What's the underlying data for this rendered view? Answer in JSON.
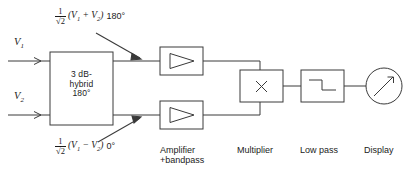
{
  "diagram": {
    "stroke_color": "#3a3a3a",
    "text_color": "#1b1b1b",
    "background": "#ffffff",
    "inputs": [
      {
        "name": "input-v1",
        "label": "V",
        "subscript": "1"
      },
      {
        "name": "input-v2",
        "label": "V",
        "subscript": "2"
      }
    ],
    "blocks": {
      "hybrid": {
        "line1": "3 dB-",
        "line2": "hybrid",
        "line3": "180°"
      },
      "amplifier_top": {
        "symbol": "triangle-right"
      },
      "amplifier_bottom": {
        "symbol": "triangle-right"
      },
      "multiplier": {
        "symbol": "X"
      },
      "lowpass": {
        "symbol": "step-down-waveform"
      },
      "display": {
        "symbol": "meter-needle"
      }
    },
    "annotations": {
      "sum_branch": {
        "numerator": "1",
        "denominator": "√2",
        "expression": "(V1 + V2)",
        "expr_lead": "(V",
        "expr_sub1": "1",
        "expr_mid": " + V",
        "expr_sub2": "2",
        "expr_tail": ")",
        "phase": "180°"
      },
      "diff_branch": {
        "numerator": "1",
        "denominator": "√2",
        "expression": "(V1 − V2)",
        "expr_lead": "(V",
        "expr_sub1": "1",
        "expr_mid": " − V",
        "expr_sub2": "2",
        "expr_tail": ")",
        "phase": "0°"
      }
    },
    "captions": [
      {
        "name": "caption-amplifier",
        "line1": "Amplifier",
        "line2": "+bandpass"
      },
      {
        "name": "caption-multiplier",
        "line1": "Multiplier",
        "line2": ""
      },
      {
        "name": "caption-lowpass",
        "line1": "Low pass",
        "line2": ""
      },
      {
        "name": "caption-display",
        "line1": "Display",
        "line2": ""
      }
    ]
  }
}
